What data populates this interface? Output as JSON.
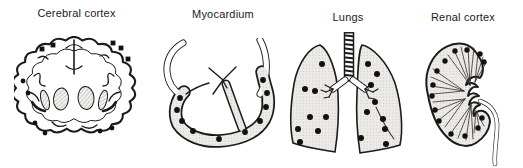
{
  "figure": {
    "background": "#ffffff",
    "ink": "#1b1b1b",
    "dot_color": "#111111",
    "organ_fill": "#ecebe7",
    "stipple_dot": "#c6c5be",
    "hatch_line": "#91908a",
    "panels": [
      {
        "id": "cerebral-cortex",
        "label": "Cerebral cortex",
        "dots": [
          [
            28,
            13,
            "s"
          ],
          [
            39,
            9,
            "s"
          ],
          [
            99,
            7,
            "s"
          ],
          [
            107,
            12,
            "s"
          ],
          [
            114,
            23,
            "s"
          ],
          [
            9,
            45
          ],
          [
            14,
            57
          ],
          [
            21,
            87
          ],
          [
            31,
            97
          ],
          [
            86,
            95
          ],
          [
            98,
            92
          ]
        ]
      },
      {
        "id": "myocardium",
        "label": "Myocardium",
        "dots": [
          [
            20,
            60
          ],
          [
            17,
            72
          ],
          [
            22,
            83
          ],
          [
            33,
            93
          ],
          [
            59,
            101
          ],
          [
            85,
            94
          ],
          [
            100,
            83
          ],
          [
            106,
            69
          ],
          [
            107,
            55
          ],
          [
            103,
            42
          ]
        ]
      },
      {
        "id": "lungs",
        "label": "Lungs",
        "dots": [
          [
            39,
            32
          ],
          [
            22,
            57
          ],
          [
            32,
            59
          ],
          [
            27,
            85
          ],
          [
            43,
            85
          ],
          [
            15,
            97
          ],
          [
            35,
            99
          ],
          [
            17,
            110
          ],
          [
            85,
            32
          ],
          [
            94,
            42
          ],
          [
            88,
            53
          ],
          [
            92,
            70
          ],
          [
            84,
            80
          ],
          [
            100,
            87
          ],
          [
            102,
            97
          ],
          [
            78,
            106
          ],
          [
            103,
            112
          ]
        ]
      },
      {
        "id": "renal-cortex",
        "label": "Renal cortex",
        "dots": [
          [
            35,
            16
          ],
          [
            47,
            15
          ],
          [
            25,
            26
          ],
          [
            60,
            19
          ],
          [
            64,
            27
          ],
          [
            17,
            36
          ],
          [
            13,
            50
          ],
          [
            12,
            61
          ],
          [
            15,
            75
          ],
          [
            19,
            86
          ],
          [
            62,
            83
          ],
          [
            58,
            93
          ],
          [
            45,
            101
          ],
          [
            31,
            99
          ]
        ]
      }
    ]
  }
}
